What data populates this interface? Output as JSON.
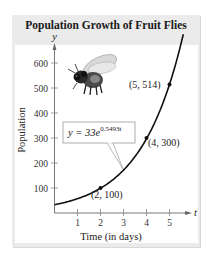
{
  "chart_data": {
    "type": "line",
    "title": "Population Growth of Fruit Flies",
    "xlabel": "Time (in days)",
    "ylabel": "Population",
    "x_axis_symbol": "t",
    "y_axis_symbol": "y",
    "xlim": [
      0,
      5.6
    ],
    "ylim": [
      0,
      650
    ],
    "x_ticks": [
      1,
      2,
      3,
      4,
      5
    ],
    "y_ticks": [
      100,
      200,
      300,
      400,
      500,
      600
    ],
    "grid": false,
    "legend": null,
    "series": [
      {
        "name": "y = 33e^(0.5493t)",
        "model": {
          "a": 33,
          "k": 0.5493
        },
        "x": [
          0,
          0.5,
          1,
          1.5,
          2,
          2.5,
          3,
          3.5,
          4,
          4.5,
          5,
          5.4
        ],
        "values": [
          33,
          43.6,
          57.2,
          75.3,
          98.9,
          130.1,
          171.0,
          224.8,
          295.6,
          388.6,
          510.9,
          636.0
        ]
      }
    ],
    "marked_points": [
      {
        "x": 2,
        "y": 100,
        "label": "(2, 100)"
      },
      {
        "x": 4,
        "y": 300,
        "label": "(4, 300)"
      },
      {
        "x": 5,
        "y": 514,
        "label": "(5, 514)"
      }
    ],
    "annotations": [
      {
        "text": "y = 33e^(0.5493t)",
        "type": "callout-box",
        "points_to_x": 3.05
      }
    ],
    "illustration": "fruit-fly"
  },
  "labels": {
    "title": "Population Growth of Fruit Flies",
    "xlabel": "Time (in days)",
    "ylabel": "Population",
    "x_symbol": "t",
    "y_symbol": "y",
    "eq_base": "y = 33e",
    "eq_exp": "0.5493t",
    "x_tick_labels": [
      "1",
      "2",
      "3",
      "4",
      "5"
    ],
    "y_tick_labels": [
      "100",
      "200",
      "300",
      "400",
      "500",
      "600"
    ],
    "point_labels": [
      "(2, 100)",
      "(4, 300)",
      "(5, 514)"
    ]
  },
  "colors": {
    "panel_bg": "#ebebeb",
    "plot_bg": "#ffffff",
    "curve": "#111111",
    "axis": "#555555"
  }
}
